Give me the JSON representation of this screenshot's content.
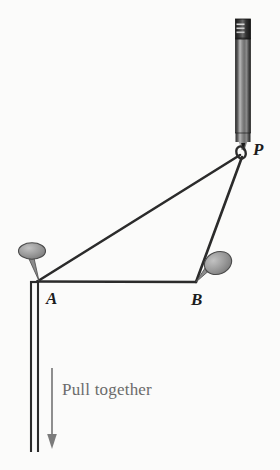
{
  "figure": {
    "background_color": "#fbfbfa",
    "ink_color": "#2b2b2b",
    "caption_color": "#6b6b6b",
    "pin_head_color": "#9a9a9a",
    "pin_head_outline": "#4a4a4a",
    "pencil_body_color": "#6e6e6e",
    "pencil_ferrule_color": "#242424",
    "width": 280,
    "height": 470
  },
  "labels": {
    "point_a": "A",
    "point_b": "B",
    "point_p": "P",
    "pull_together": "Pull together"
  },
  "geometry": {
    "point_a": {
      "x": 38,
      "y": 281
    },
    "point_b": {
      "x": 195,
      "y": 282
    },
    "point_p": {
      "x": 241,
      "y": 153
    },
    "pin_a_head": {
      "cx": 32,
      "cy": 252,
      "rx": 13,
      "ry": 8
    },
    "pin_b_head": {
      "cx": 217,
      "cy": 264,
      "rx": 14,
      "ry": 11
    },
    "pencil_tip": {
      "x": 243,
      "y": 146
    },
    "pencil_top": {
      "x": 243,
      "y": 19
    },
    "string_bottom_y": 452,
    "arrow_x": 52,
    "arrow_top_y": 368,
    "arrow_tip_y": 448
  },
  "icon_names": {
    "pencil": "pencil-icon",
    "pin_a": "pushpin-icon",
    "pin_b": "pushpin-icon",
    "arrow": "down-arrow-icon",
    "knot": "string-loop-icon"
  }
}
